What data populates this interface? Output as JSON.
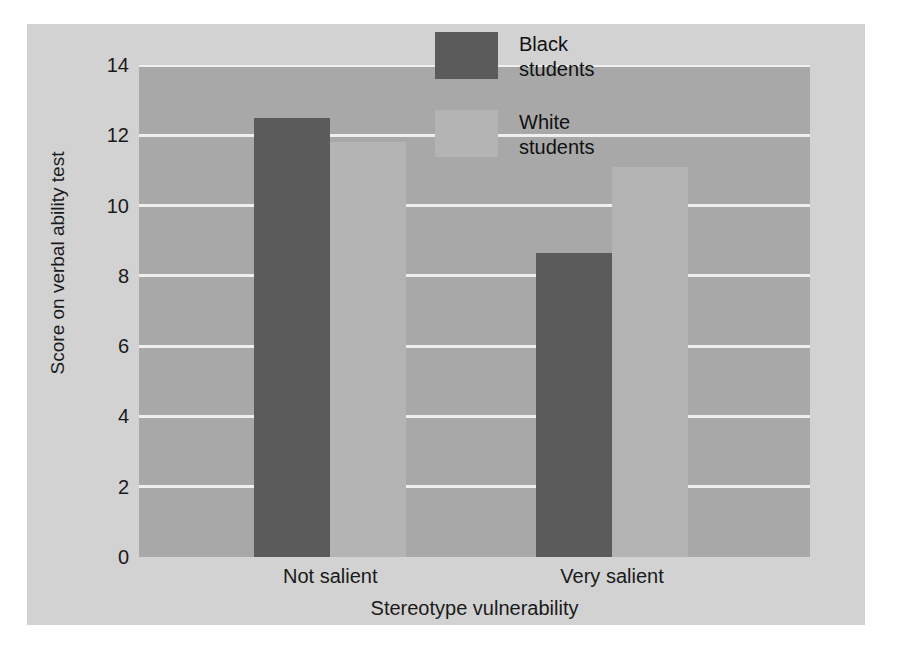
{
  "chart_data": {
    "type": "bar",
    "title": "",
    "xlabel": "Stereotype vulnerability",
    "ylabel": "Score on verbal ability test",
    "categories": [
      "Not salient",
      "Very salient"
    ],
    "series": [
      {
        "name": "Black\nstudents",
        "values": [
          12.5,
          8.65
        ],
        "color": "#5b5b5b"
      },
      {
        "name": "White\nstudents",
        "values": [
          11.8,
          11.1
        ],
        "color": "#b4b4b4"
      }
    ],
    "ylim": [
      0,
      14
    ],
    "yticks": [
      0,
      2,
      4,
      6,
      8,
      10,
      12,
      14
    ],
    "ytick_labels": [
      "0",
      "2",
      "4",
      "6",
      "8",
      "10",
      "12",
      "14"
    ],
    "grid": true,
    "grid_color": "#efefef",
    "legend_position": "top-center",
    "plot_background": "#a8a8a8",
    "figure_background": "#d2d2d2"
  },
  "legend": {
    "entries": [
      {
        "label": "Black\nstudents"
      },
      {
        "label": "White\nstudents"
      }
    ]
  }
}
